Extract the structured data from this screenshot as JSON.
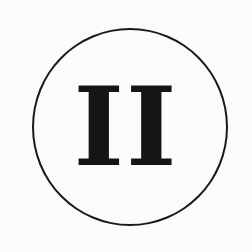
{
  "emblem": {
    "numeral": "II",
    "stroke_color": "#1a1a1a",
    "text_color": "#151515",
    "background_color": "#fbfbfa"
  }
}
